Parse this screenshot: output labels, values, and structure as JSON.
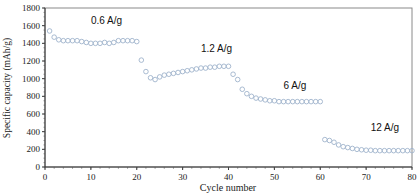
{
  "chart_data": {
    "type": "scatter",
    "title": "",
    "xlabel": "Cycle number",
    "ylabel": "Specific capacity (mAh/g)",
    "xlim": [
      0,
      80
    ],
    "ylim": [
      0,
      1800
    ],
    "xticks": [
      0,
      10,
      20,
      30,
      40,
      50,
      60,
      70,
      80
    ],
    "yticks": [
      0,
      200,
      400,
      600,
      800,
      1000,
      1200,
      1400,
      1600,
      1800
    ],
    "grid": false,
    "legend": null,
    "marker": "hollow-circle",
    "marker_color": "#9fb3cc",
    "annotations": [
      {
        "text": "0.6 A/g",
        "x": 10,
        "y": 1620
      },
      {
        "text": "1.2 A/g",
        "x": 34,
        "y": 1300
      },
      {
        "text": "6 A/g",
        "x": 52,
        "y": 880
      },
      {
        "text": "12 A/g",
        "x": 71,
        "y": 410
      }
    ],
    "series": [
      {
        "name": "Specific capacity",
        "x": [
          1,
          2,
          3,
          4,
          5,
          6,
          7,
          8,
          9,
          10,
          11,
          12,
          13,
          14,
          15,
          16,
          17,
          18,
          19,
          20,
          21,
          22,
          23,
          24,
          25,
          26,
          27,
          28,
          29,
          30,
          31,
          32,
          33,
          34,
          35,
          36,
          37,
          38,
          39,
          40,
          41,
          42,
          43,
          44,
          45,
          46,
          47,
          48,
          49,
          50,
          51,
          52,
          53,
          54,
          55,
          56,
          57,
          58,
          59,
          60,
          61,
          62,
          63,
          64,
          65,
          66,
          67,
          68,
          69,
          70,
          71,
          72,
          73,
          74,
          75,
          76,
          77,
          78,
          79,
          80
        ],
        "values": [
          1540,
          1470,
          1440,
          1430,
          1430,
          1430,
          1430,
          1420,
          1410,
          1400,
          1400,
          1400,
          1410,
          1400,
          1410,
          1430,
          1430,
          1430,
          1430,
          1420,
          1210,
          1080,
          1010,
          990,
          1020,
          1040,
          1050,
          1060,
          1070,
          1080,
          1090,
          1100,
          1110,
          1120,
          1120,
          1130,
          1130,
          1140,
          1140,
          1140,
          1050,
          990,
          880,
          830,
          800,
          780,
          770,
          760,
          750,
          750,
          740,
          740,
          740,
          740,
          740,
          740,
          740,
          740,
          740,
          740,
          310,
          300,
          280,
          250,
          230,
          220,
          210,
          200,
          195,
          190,
          190,
          185,
          185,
          185,
          185,
          185,
          185,
          185,
          185,
          185
        ]
      }
    ]
  }
}
